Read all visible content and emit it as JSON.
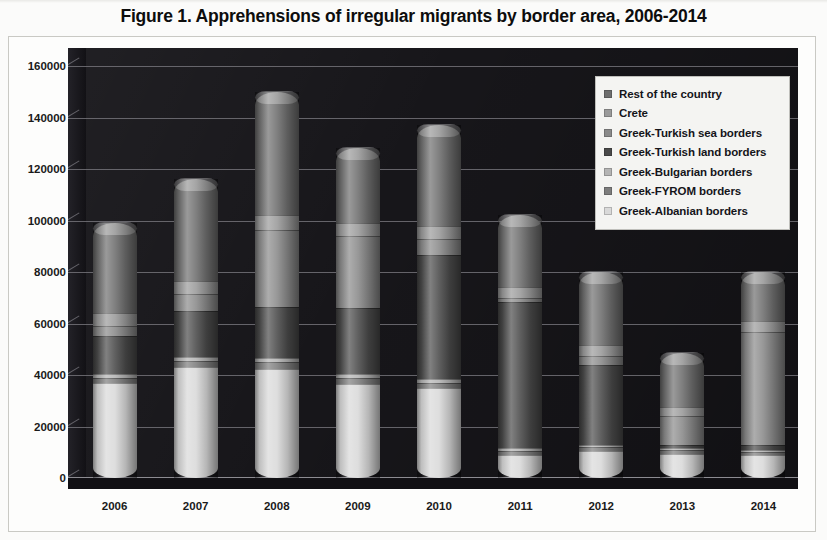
{
  "figure": {
    "title": "Figure 1. Apprehensions of irregular migrants by border area, 2006-2014"
  },
  "legend": {
    "position": "top-right",
    "items": [
      {
        "label": "Rest of the country",
        "color": "#6e6e6e"
      },
      {
        "label": "Crete",
        "color": "#9a9a9a"
      },
      {
        "label": "Greek-Turkish sea borders",
        "color": "#8a8a8a"
      },
      {
        "label": "Greek-Turkish land borders",
        "color": "#4a4a4a"
      },
      {
        "label": "Greek-Bulgarian borders",
        "color": "#b4b4b4"
      },
      {
        "label": "Greek-FYROM borders",
        "color": "#7d7d7d"
      },
      {
        "label": "Greek-Albanian borders",
        "color": "#d9d9d9"
      }
    ]
  },
  "axes": {
    "y_ticks": [
      "0",
      "20000",
      "40000",
      "60000",
      "80000",
      "100000",
      "120000",
      "140000",
      "160000"
    ],
    "x_ticks": [
      "2006",
      "2007",
      "2008",
      "2009",
      "2010",
      "2011",
      "2012",
      "2013",
      "2014"
    ]
  },
  "chart_data": {
    "type": "bar",
    "stacked": true,
    "title": "Figure 1. Apprehensions of irregular migrants by border area, 2006-2014",
    "xlabel": "",
    "ylabel": "",
    "ylim": [
      0,
      160000
    ],
    "ytick_step": 20000,
    "grid": true,
    "legend_position": "top-right",
    "categories": [
      "2006",
      "2007",
      "2008",
      "2009",
      "2010",
      "2011",
      "2012",
      "2013",
      "2014"
    ],
    "stack_order_bottom_to_top": [
      "Greek-Albanian borders",
      "Greek-FYROM borders",
      "Greek-Bulgarian borders",
      "Greek-Turkish land borders",
      "Greek-Turkish sea borders",
      "Crete",
      "Rest of the country"
    ],
    "series": [
      {
        "name": "Greek-Albanian borders",
        "color": "#d9d9d9",
        "values": [
          37000,
          43000,
          42500,
          36500,
          35000,
          9000,
          10500,
          9500,
          9000
        ]
      },
      {
        "name": "Greek-FYROM borders",
        "color": "#7d7d7d",
        "values": [
          2000,
          2500,
          2500,
          2500,
          2000,
          1500,
          1500,
          1200,
          1200
        ]
      },
      {
        "name": "Greek-Bulgarian borders",
        "color": "#b4b4b4",
        "values": [
          1500,
          1500,
          1500,
          1500,
          1500,
          1000,
          1000,
          800,
          800
        ]
      },
      {
        "name": "Greek-Turkish land borders",
        "color": "#4a4a4a",
        "values": [
          14500,
          18000,
          20000,
          25500,
          48000,
          57000,
          31000,
          1500,
          1800
        ]
      },
      {
        "name": "Greek-Turkish sea borders",
        "color": "#8a8a8a",
        "values": [
          4000,
          6500,
          30000,
          28000,
          6500,
          1500,
          3500,
          11000,
          44000
        ]
      },
      {
        "name": "Crete",
        "color": "#9a9a9a",
        "values": [
          5000,
          5000,
          5500,
          5000,
          5000,
          4000,
          4000,
          3500,
          4000
        ]
      },
      {
        "name": "Rest of the country",
        "color": "#6e6e6e",
        "values": [
          35000,
          39500,
          48000,
          29000,
          39000,
          28000,
          28500,
          21000,
          19200
        ]
      }
    ],
    "totals": [
      99000,
      116000,
      150000,
      128000,
      137000,
      102000,
      80000,
      48500,
      80000
    ]
  }
}
